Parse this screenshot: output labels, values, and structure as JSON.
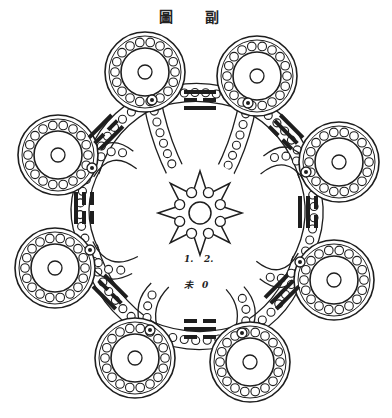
{
  "title": "圖 副",
  "colors": {
    "ink": "#1e1e1e",
    "paper": "#ffffff"
  },
  "labels": {
    "one": "1.",
    "two": "2.",
    "char": "未",
    "zero": "0"
  },
  "trigrams": {
    "top": {
      "name": "li",
      "lines": [
        "solid",
        "broken",
        "solid"
      ]
    },
    "bottom": {
      "name": "kan",
      "lines": [
        "broken",
        "solid",
        "broken"
      ]
    },
    "left": {
      "lines": [
        "solid",
        "broken",
        "broken"
      ]
    },
    "right": {
      "lines": [
        "broken",
        "solid",
        "solid"
      ]
    }
  },
  "rings": [
    {
      "id": "top-left",
      "cx": 145,
      "cy": 72
    },
    {
      "id": "top-right",
      "cx": 257,
      "cy": 76
    },
    {
      "id": "left-upper",
      "cx": 58,
      "cy": 155
    },
    {
      "id": "right-upper",
      "cx": 339,
      "cy": 162
    },
    {
      "id": "left-lower",
      "cx": 55,
      "cy": 268
    },
    {
      "id": "right-lower",
      "cx": 334,
      "cy": 280
    },
    {
      "id": "bottom-left",
      "cx": 135,
      "cy": 358
    },
    {
      "id": "bottom-right",
      "cx": 250,
      "cy": 362
    }
  ],
  "center_star": {
    "cx": 200,
    "cy": 213,
    "points": 8
  }
}
